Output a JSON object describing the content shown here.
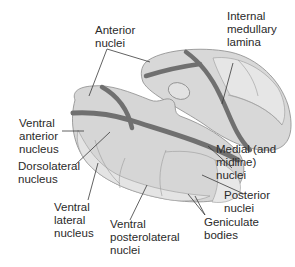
{
  "diagram": {
    "colors": {
      "structure_fill": "#d6d6d6",
      "structure_fill_light": "#e6e6e6",
      "structure_stroke": "#8a8a8a",
      "lamina": "#707070",
      "leader_line": "#3a3a3a",
      "text": "#2a2a2a",
      "background": "#ffffff"
    },
    "labels": [
      {
        "id": "anterior-nuclei",
        "text": "Anterior\nnuclei"
      },
      {
        "id": "internal-medullary-lamina",
        "text": "Internal\nmedullary\nlamina"
      },
      {
        "id": "ventral-anterior-nucleus",
        "text": "Ventral\nanterior\nnucleus"
      },
      {
        "id": "dorsolateral-nucleus",
        "text": "Dorsolateral\nnucleus"
      },
      {
        "id": "medial-and-midline-nuclei",
        "text": "Medial (and\nmidline)\nnuclei"
      },
      {
        "id": "posterior-nuclei",
        "text": "Posterior\nnuclei"
      },
      {
        "id": "ventral-lateral-nucleus",
        "text": "Ventral\nlateral\nnucleus"
      },
      {
        "id": "ventral-posterolateral-nuclei",
        "text": "Ventral\nposterolateral\nnuclei"
      },
      {
        "id": "geniculate-bodies",
        "text": "Geniculate\nbodies"
      }
    ]
  }
}
